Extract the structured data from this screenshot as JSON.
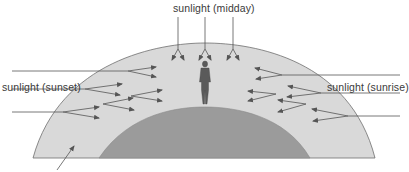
{
  "diagram": {
    "labels": {
      "midday": "sunlight (midday)",
      "sunset": "sunlight (sunset)",
      "sunrise": "sunlight (sunrise)"
    },
    "colors": {
      "atmosphere": "#d9d9d9",
      "earth": "#9b9b9b",
      "outline": "#6e6e6e",
      "ray": "#555555",
      "figure": "#5a5a5a"
    },
    "elements": [
      {
        "name": "atmosphere-layer",
        "description": "light grey outer shell"
      },
      {
        "name": "earth-surface",
        "description": "dark grey inner dome"
      },
      {
        "name": "observer-figure",
        "description": "person standing on top of earth"
      },
      {
        "name": "atmosphere-pointer-arrow",
        "description": "arrow pointing at atmosphere from bottom-left"
      }
    ]
  }
}
